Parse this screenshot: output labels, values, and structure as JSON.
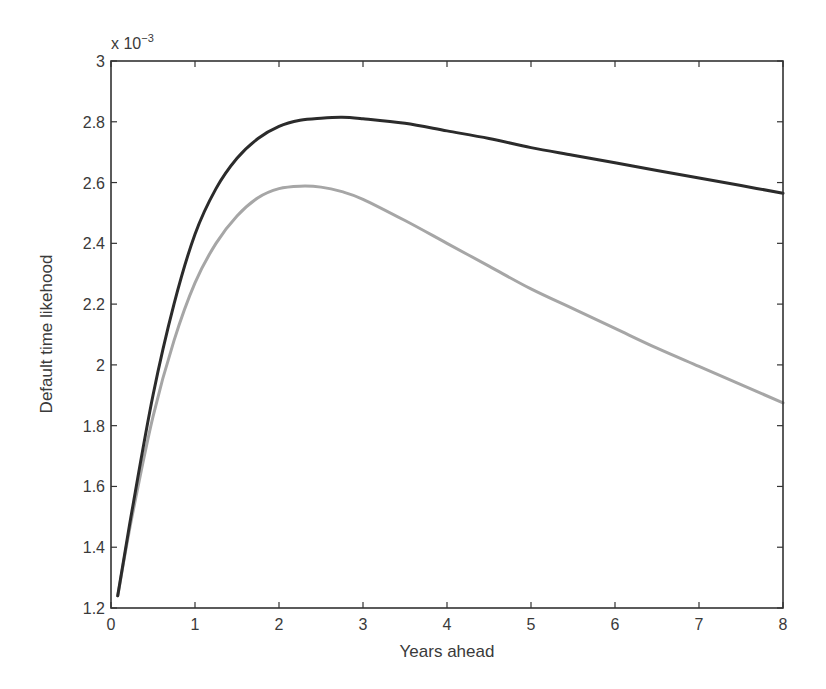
{
  "chart_data": {
    "type": "line",
    "title": "",
    "xlabel": "Years ahead",
    "ylabel": "Default time likehood",
    "y_exponent_label": "x 10^-3",
    "y_exponent": {
      "base": "x 10",
      "power": "−3"
    },
    "xlim": [
      0,
      8
    ],
    "ylim": [
      1.2,
      3.0
    ],
    "x_ticks": [
      0,
      1,
      2,
      3,
      4,
      5,
      6,
      7,
      8
    ],
    "y_ticks": [
      1.2,
      1.4,
      1.6,
      1.8,
      2,
      2.2,
      2.4,
      2.6,
      2.8,
      3
    ],
    "x_tick_labels": [
      "0",
      "1",
      "2",
      "3",
      "4",
      "5",
      "6",
      "7",
      "8"
    ],
    "y_tick_labels": [
      "1.2",
      "1.4",
      "1.6",
      "1.8",
      "2",
      "2.2",
      "2.4",
      "2.6",
      "2.8",
      "3"
    ],
    "grid": false,
    "legend": null,
    "series": [
      {
        "name": "dark curve",
        "color": "#2b2b2b",
        "width": 3,
        "x": [
          0.08,
          0.25,
          0.5,
          0.75,
          1.0,
          1.25,
          1.5,
          1.75,
          2.0,
          2.25,
          2.5,
          2.75,
          3.0,
          3.5,
          4.0,
          4.5,
          5.0,
          5.5,
          6.0,
          6.5,
          7.0,
          7.5,
          8.0
        ],
        "y": [
          1.24,
          1.52,
          1.9,
          2.2,
          2.43,
          2.58,
          2.68,
          2.745,
          2.785,
          2.805,
          2.812,
          2.815,
          2.81,
          2.795,
          2.77,
          2.745,
          2.715,
          2.69,
          2.665,
          2.64,
          2.615,
          2.59,
          2.565
        ]
      },
      {
        "name": "light curve",
        "color": "#a6a6a6",
        "width": 3,
        "x": [
          0.08,
          0.25,
          0.5,
          0.75,
          1.0,
          1.25,
          1.5,
          1.75,
          2.0,
          2.25,
          2.5,
          2.75,
          3.0,
          3.5,
          4.0,
          4.5,
          5.0,
          5.5,
          6.0,
          6.5,
          7.0,
          7.5,
          8.0
        ],
        "y": [
          1.24,
          1.5,
          1.83,
          2.08,
          2.27,
          2.4,
          2.49,
          2.55,
          2.58,
          2.588,
          2.585,
          2.57,
          2.545,
          2.475,
          2.4,
          2.325,
          2.25,
          2.185,
          2.12,
          2.055,
          1.995,
          1.935,
          1.875
        ]
      }
    ]
  },
  "layout": {
    "plot_left": 111,
    "plot_right": 783,
    "plot_top": 61,
    "plot_bottom": 608
  }
}
